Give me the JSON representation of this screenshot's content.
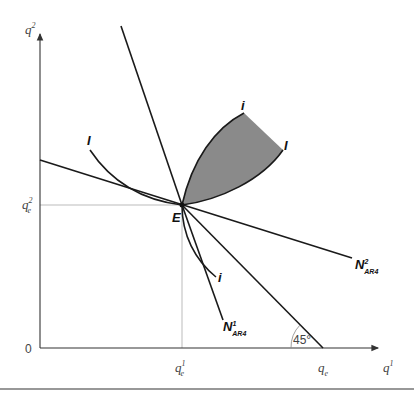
{
  "diagram": {
    "axes": {
      "x_label": "q",
      "x_label_sup": "1",
      "y_label": "q",
      "y_label_sup": "2",
      "origin_label": "0"
    },
    "ticks": {
      "qe1": {
        "base": "q",
        "sub": "e",
        "sup": "1"
      },
      "qe2": {
        "base": "q",
        "sub": "e",
        "sup": "2"
      },
      "qe": {
        "base": "q",
        "sub": "e"
      }
    },
    "point_E": "E",
    "curves": {
      "I_left": "I",
      "I_right": "I",
      "i_top": "i",
      "i_bottom": "i"
    },
    "lines": {
      "N1": {
        "base": "N",
        "sup": "1",
        "sub": "AR4"
      },
      "N2": {
        "base": "N",
        "sup": "2",
        "sub": "AR4"
      }
    },
    "angle_label": "45°",
    "colors": {
      "shaded_region": "#8a8a8a",
      "lines": "#1a1a1a",
      "guides": "#aaaaaa"
    }
  }
}
